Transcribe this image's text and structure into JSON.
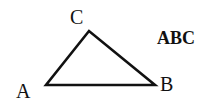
{
  "diagram": {
    "title": "ABC",
    "vertices": [
      {
        "label": "A",
        "x": 46,
        "y": 85
      },
      {
        "label": "B",
        "x": 155,
        "y": 85
      },
      {
        "label": "C",
        "x": 89,
        "y": 31
      }
    ],
    "stroke_color": "#111111"
  }
}
